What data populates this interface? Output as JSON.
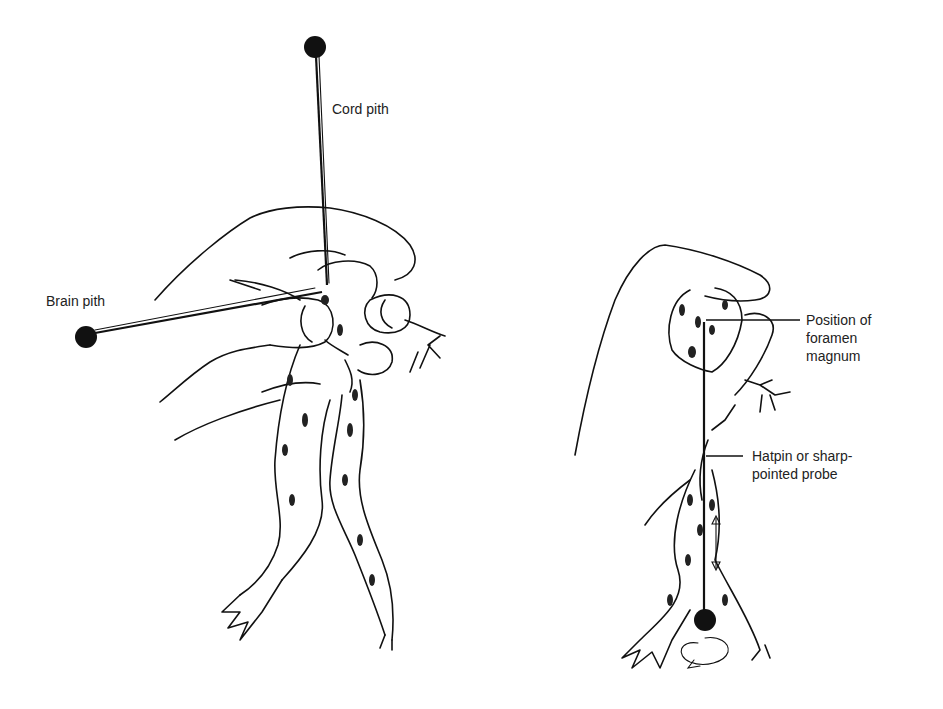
{
  "figure": {
    "left_panel": {
      "description": "Hand holding frog with brain and cord pithing needles",
      "labels": {
        "cord_pith": "Cord pith",
        "brain_pith": "Brain pith"
      }
    },
    "right_panel": {
      "description": "Hand holding frog with hatpin inserted at foramen magnum",
      "labels": {
        "foramen_line1": "Position of",
        "foramen_line2": "foramen",
        "foramen_line3": "magnum",
        "probe_line1": "Hatpin  or sharp-",
        "probe_line2": "pointed probe"
      }
    },
    "colors": {
      "ink": "#111111",
      "background": "#ffffff"
    }
  }
}
